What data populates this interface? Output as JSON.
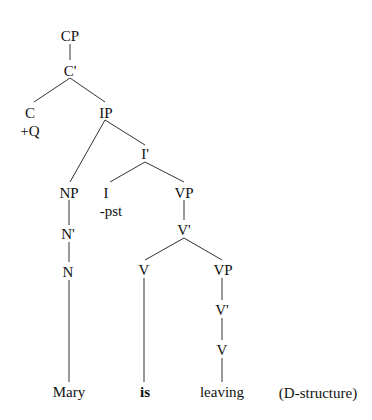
{
  "diagram": {
    "type": "syntax-tree",
    "caption": "(D-structure)",
    "nodes": {
      "cp": "CP",
      "c_bar": "C'",
      "c": "C",
      "c_feature": "+Q",
      "ip": "IP",
      "i_bar": "I'",
      "i": "I",
      "i_feature": "-pst",
      "np": "NP",
      "n_bar": "N'",
      "n": "N",
      "vp1": "VP",
      "v_bar1": "V'",
      "v1": "V",
      "vp2": "VP",
      "v_bar2": "V'",
      "v2": "V"
    },
    "leaves": {
      "mary": "Mary",
      "is": "is",
      "leaving": "leaving"
    }
  }
}
